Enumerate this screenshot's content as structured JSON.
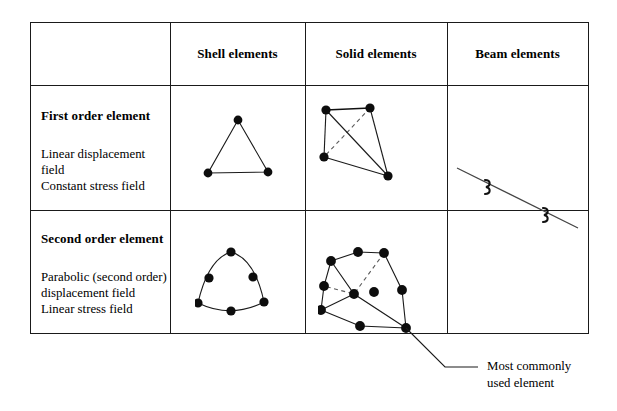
{
  "figure": {
    "columns": [
      {
        "key": "blank",
        "label": ""
      },
      {
        "key": "shell",
        "label": "Shell elements"
      },
      {
        "key": "solid",
        "label": "Solid elements"
      },
      {
        "key": "beam",
        "label": "Beam elements"
      }
    ],
    "rows": [
      {
        "key": "first-order",
        "heading": "First order element",
        "description_lines": [
          "Linear displacement",
          "field",
          "Constant stress field"
        ]
      },
      {
        "key": "second-order",
        "heading": "Second order element",
        "description_lines": [
          "Parabolic (second order)",
          "displacement field",
          "Linear stress field"
        ]
      }
    ],
    "annotation": {
      "line1": "Most commonly",
      "line2": "used element"
    },
    "colors": {
      "border": "#1a1a1a",
      "node": "#0d0d0d",
      "edge": "#1a1a1a",
      "hidden_edge": "#5a5a5a",
      "background": "#ffffff"
    }
  },
  "diagrams": {
    "shell_first_order": {
      "name": "linear triangular shell element",
      "node_count": 3,
      "nodes": [
        {
          "x": 43,
          "y": 10
        },
        {
          "x": 13,
          "y": 63
        },
        {
          "x": 73,
          "y": 62
        }
      ]
    },
    "solid_first_order": {
      "name": "linear tetrahedral solid element",
      "node_count": 4,
      "nodes": [
        {
          "x": 21,
          "y": 15
        },
        {
          "x": 65,
          "y": 13
        },
        {
          "x": 19,
          "y": 62
        },
        {
          "x": 83,
          "y": 81
        }
      ]
    },
    "beam_first_order": {
      "name": "beam element with cross-section markers",
      "node_count": 0,
      "cross_section_markers": 2
    },
    "shell_second_order": {
      "name": "parabolic six-node triangular shell element",
      "node_count": 6,
      "nodes": [
        {
          "x": 36,
          "y": 7
        },
        {
          "x": 14,
          "y": 33
        },
        {
          "x": 58,
          "y": 32
        },
        {
          "x": 3,
          "y": 58
        },
        {
          "x": 36,
          "y": 66
        },
        {
          "x": 69,
          "y": 57
        }
      ]
    },
    "solid_second_order": {
      "name": "parabolic ten-node tetrahedral solid element",
      "node_count": 10,
      "nodes": [
        {
          "x": 13,
          "y": 21
        },
        {
          "x": 40,
          "y": 12
        },
        {
          "x": 66,
          "y": 13
        },
        {
          "x": 6,
          "y": 46
        },
        {
          "x": 3,
          "y": 70
        },
        {
          "x": 36,
          "y": 54
        },
        {
          "x": 56,
          "y": 52
        },
        {
          "x": 84,
          "y": 50
        },
        {
          "x": 42,
          "y": 86
        },
        {
          "x": 88,
          "y": 88
        }
      ]
    }
  }
}
